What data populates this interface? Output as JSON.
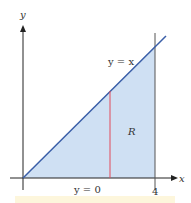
{
  "figure": {
    "axes": {
      "x_label": "x",
      "y_label": "y"
    },
    "curves": [
      {
        "label": "y = x",
        "color": "#3b5fa8"
      },
      {
        "label": "y = 0"
      }
    ],
    "region": {
      "label": "R",
      "fill": "#cfe0f3"
    },
    "tick_labels": {
      "x4": "4"
    },
    "colors": {
      "axis": "#222222",
      "line": "#3b5fa8",
      "strip": "#e24a5a",
      "boundary": "#555555",
      "footer": "#fdf6dc"
    }
  }
}
